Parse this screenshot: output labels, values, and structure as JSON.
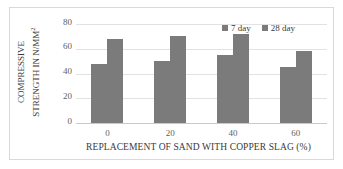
{
  "chart_data": {
    "type": "bar",
    "title": "",
    "xlabel": "REPLACEMENT OF SAND WITH COPPER SLAG (%)",
    "ylabel_line1": "COMPRESSIVE",
    "ylabel_line2": "STRENGTH IN N/MM",
    "ylabel_exponent": "2",
    "ylabel": "COMPRESSIVE STRENGTH IN N/MM²",
    "categories": [
      "0",
      "20",
      "40",
      "60"
    ],
    "series": [
      {
        "name": "7 day",
        "values": [
          48,
          50,
          55,
          45
        ],
        "color": "#7b7b7b"
      },
      {
        "name": "28 day",
        "values": [
          68,
          70,
          72,
          58
        ],
        "color": "#7b7b7b"
      }
    ],
    "ylim": [
      0,
      80
    ],
    "yticks": [
      "80",
      "60",
      "40",
      "20",
      "0"
    ],
    "ytick_values": [
      80,
      60,
      40,
      20,
      0
    ],
    "grid": true,
    "legend_position": "top-right",
    "bar_color": "#7b7b7b",
    "gridline_color": "#e2e2e2",
    "border_color": "#d9d9d9",
    "background": "#ffffff"
  },
  "legend": {
    "items": [
      {
        "label": "7 day",
        "marker": "square-marker-icon"
      },
      {
        "label": "28 day",
        "marker": "square-marker-icon"
      }
    ]
  }
}
